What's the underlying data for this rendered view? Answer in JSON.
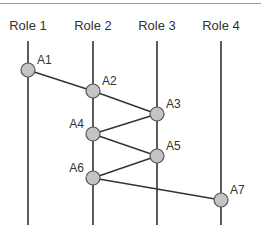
{
  "diagram": {
    "type": "swimlane-sequence",
    "roles": [
      {
        "id": "r1",
        "label": "Role 1"
      },
      {
        "id": "r2",
        "label": "Role 2"
      },
      {
        "id": "r3",
        "label": "Role 3"
      },
      {
        "id": "r4",
        "label": "Role 4"
      }
    ],
    "activities": [
      {
        "id": "A1",
        "label": "A1",
        "role": "r1",
        "step": 1
      },
      {
        "id": "A2",
        "label": "A2",
        "role": "r2",
        "step": 2
      },
      {
        "id": "A3",
        "label": "A3",
        "role": "r3",
        "step": 3
      },
      {
        "id": "A4",
        "label": "A4",
        "role": "r2",
        "step": 4
      },
      {
        "id": "A5",
        "label": "A5",
        "role": "r3",
        "step": 5
      },
      {
        "id": "A6",
        "label": "A6",
        "role": "r2",
        "step": 6
      },
      {
        "id": "A7",
        "label": "A7",
        "role": "r4",
        "step": 7
      }
    ],
    "edges": [
      {
        "from": "A1",
        "to": "A2"
      },
      {
        "from": "A2",
        "to": "A3"
      },
      {
        "from": "A3",
        "to": "A4"
      },
      {
        "from": "A4",
        "to": "A5"
      },
      {
        "from": "A5",
        "to": "A6"
      },
      {
        "from": "A6",
        "to": "A7"
      }
    ],
    "colors": {
      "line": "#333333",
      "node_fill": "#c4c4c4",
      "node_stroke": "#555555",
      "text": "#333333"
    }
  }
}
